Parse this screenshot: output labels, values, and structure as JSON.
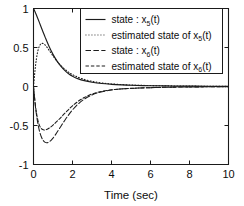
{
  "chart_data": {
    "type": "line",
    "title": "",
    "xlabel": "Time (sec)",
    "ylabel": "",
    "xlim": [
      0,
      10
    ],
    "ylim": [
      -1,
      1
    ],
    "grid": false,
    "legend_position": "upper-right",
    "xticks": [
      0,
      2,
      4,
      6,
      8,
      10
    ],
    "xticklabels": [
      "0",
      "2",
      "4",
      "6",
      "8",
      "10"
    ],
    "yticks": [
      -1,
      -0.5,
      0,
      0.5,
      1
    ],
    "yticklabels": [
      "-1",
      "-0.5",
      "0",
      "0.5",
      "1"
    ],
    "series": [
      {
        "name": "state : x5(t)",
        "label_prefix": "state : x",
        "label_sub": "5",
        "label_suffix": "(t)",
        "style": "solid",
        "color": "#1c1c1c",
        "x": [
          0,
          0.1,
          0.2,
          0.3,
          0.4,
          0.5,
          0.6,
          0.8,
          1.0,
          1.2,
          1.4,
          1.6,
          1.8,
          2.0,
          2.3,
          2.6,
          3.0,
          3.5,
          4.0,
          4.5,
          5.0,
          6.0,
          7.0,
          8.0,
          9.0,
          10.0
        ],
        "y": [
          1.0,
          0.945,
          0.885,
          0.822,
          0.757,
          0.693,
          0.63,
          0.513,
          0.412,
          0.328,
          0.26,
          0.206,
          0.164,
          0.132,
          0.098,
          0.075,
          0.055,
          0.038,
          0.028,
          0.021,
          0.016,
          0.01,
          0.007,
          0.005,
          0.003,
          0.002
        ]
      },
      {
        "name": "estimated state of x5(t)",
        "label_prefix": "estimated state of x",
        "label_sub": "5",
        "label_suffix": "(t)",
        "style": "dotted",
        "color": "#1c1c1c",
        "x": [
          0,
          0.08,
          0.15,
          0.22,
          0.3,
          0.38,
          0.45,
          0.52,
          0.6,
          0.7,
          0.8,
          0.95,
          1.1,
          1.3,
          1.5,
          1.8,
          2.1,
          2.5,
          3.0,
          3.5,
          4.0,
          5.0,
          6.0,
          7.0,
          8.0,
          9.0,
          10.0
        ],
        "y": [
          0.0,
          0.21,
          0.355,
          0.452,
          0.516,
          0.547,
          0.553,
          0.548,
          0.532,
          0.5,
          0.465,
          0.41,
          0.358,
          0.296,
          0.245,
          0.183,
          0.14,
          0.099,
          0.066,
          0.046,
          0.033,
          0.019,
          0.012,
          0.008,
          0.005,
          0.003,
          0.002
        ]
      },
      {
        "name": "state : x6(t)",
        "label_prefix": "state : x",
        "label_sub": "6",
        "label_suffix": "(t)",
        "style": "dashdot",
        "color": "#1c1c1c",
        "x": [
          0,
          0.1,
          0.2,
          0.3,
          0.4,
          0.5,
          0.6,
          0.7,
          0.8,
          0.9,
          1.0,
          1.2,
          1.4,
          1.6,
          1.8,
          2.0,
          2.3,
          2.6,
          3.0,
          3.4,
          4.0,
          4.6,
          5.2,
          6.0,
          7.0,
          8.0,
          9.0,
          10.0
        ],
        "y": [
          0.0,
          -0.26,
          -0.44,
          -0.565,
          -0.645,
          -0.693,
          -0.716,
          -0.72,
          -0.71,
          -0.69,
          -0.662,
          -0.59,
          -0.512,
          -0.435,
          -0.364,
          -0.3,
          -0.222,
          -0.163,
          -0.108,
          -0.074,
          -0.044,
          -0.03,
          -0.022,
          -0.015,
          -0.009,
          -0.006,
          -0.004,
          -0.003
        ]
      },
      {
        "name": "estimated state of x6(t)",
        "label_prefix": "estimated state of x",
        "label_sub": "6",
        "label_suffix": "(t)",
        "style": "dashed",
        "color": "#1c1c1c",
        "x": [
          0,
          0.1,
          0.2,
          0.3,
          0.4,
          0.5,
          0.6,
          0.7,
          0.85,
          1.0,
          1.2,
          1.4,
          1.6,
          1.8,
          2.0,
          2.3,
          2.6,
          3.0,
          3.4,
          4.0,
          4.6,
          5.2,
          6.0,
          7.0,
          8.0,
          9.0,
          10.0
        ],
        "y": [
          0.0,
          -0.245,
          -0.405,
          -0.495,
          -0.54,
          -0.556,
          -0.556,
          -0.548,
          -0.525,
          -0.495,
          -0.448,
          -0.398,
          -0.345,
          -0.295,
          -0.248,
          -0.188,
          -0.142,
          -0.096,
          -0.068,
          -0.042,
          -0.029,
          -0.021,
          -0.015,
          -0.009,
          -0.006,
          -0.004,
          -0.003
        ]
      }
    ]
  }
}
